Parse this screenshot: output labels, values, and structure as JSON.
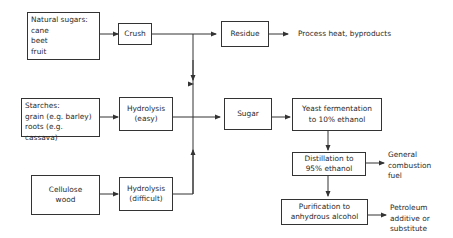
{
  "diagram": {
    "nodes": {
      "natural_sugars": {
        "title": "Natural sugars:",
        "items": [
          "cane",
          "beet",
          "fruit"
        ]
      },
      "crush": {
        "label": "Crush"
      },
      "residue": {
        "label": "Residue"
      },
      "starches": {
        "title": "Starches:",
        "items": [
          "grain (e.g. barley)",
          "roots (e.g. cassava)"
        ]
      },
      "hydrolysis_easy": {
        "line1": "Hydrolysis",
        "line2": "(easy)"
      },
      "sugar": {
        "label": "Sugar"
      },
      "yeast": {
        "line1": "Yeast fermentation",
        "line2": "to 10% ethanol"
      },
      "cellulose": {
        "line1": "Cellulose",
        "line2": "wood"
      },
      "hydrolysis_difficult": {
        "line1": "Hydrolysis",
        "line2": "(difficult)"
      },
      "distillation": {
        "line1": "Distillation to",
        "line2": "95% ethanol"
      },
      "purification": {
        "line1": "Purification to",
        "line2": "anhydrous alcohol"
      }
    },
    "outputs": {
      "process_heat": "Process heat, byproducts",
      "general_fuel": [
        "General",
        "combustion",
        "fuel"
      ],
      "petroleum": [
        "Petroleum",
        "additive or",
        "substitute"
      ]
    }
  }
}
